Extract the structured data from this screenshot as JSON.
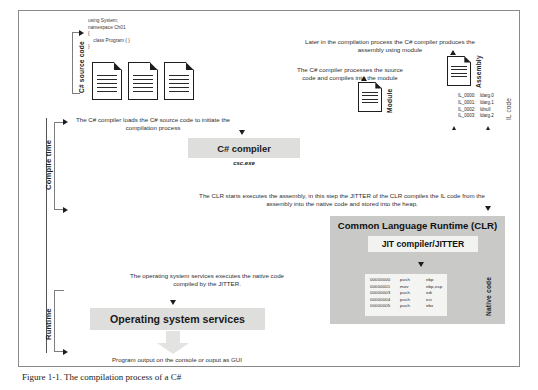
{
  "figure": {
    "caption": "Figure 1-1. The compilation process of a C#"
  },
  "timeline": {
    "compile_time_label": "Compile time",
    "runtime_label": "Runtime"
  },
  "source_stage": {
    "vertical_label": "C# source code",
    "snippet": [
      "using System;",
      "namespace Ch01",
      "{",
      "    class Program { }",
      "}"
    ],
    "doc_count": 3
  },
  "annotations": {
    "loads_source": "The C# compiler loads the C# source code to initiate the compilation process",
    "processes_source": "The C# compiler processes the source code and compiles into the module",
    "produces_assembly": "Later in the compilation process the C# compiler produces the assembly using module",
    "clr_executes": "The CLR starts executes the assembly, in this step the JITTER of the CLR compiles the IL code from the assembly into the native code and stored into the heap.",
    "os_executes": "The operating system services executes the native code compiled by the JITTER.",
    "program_output": "Program output on the console or ouput as GUI"
  },
  "compiler_box": {
    "title": "C# compiler",
    "subtitle": "csc.exe"
  },
  "module_stage": {
    "vertical_label": "Module"
  },
  "assembly_stage": {
    "vertical_label": "Assembly",
    "il_vertical_label": "IL code",
    "il_code": [
      {
        "label": "IL_0000:",
        "instr": "ldarg.0"
      },
      {
        "label": "IL_0001:",
        "instr": "ldarg.1"
      },
      {
        "label": "IL_0002:",
        "instr": "ldnull"
      },
      {
        "label": "IL_0003:",
        "instr": "ldarg.2"
      }
    ]
  },
  "clr": {
    "title": "Common Language Runtime (CLR)",
    "jit_title": "JIT compiler/JITTER",
    "native_vertical_label": "Native code",
    "native_code": [
      {
        "addr": "00000000",
        "op": "push",
        "args": "ebp"
      },
      {
        "addr": "00000001",
        "op": "mov",
        "args": "ebp,esp"
      },
      {
        "addr": "00000003",
        "op": "push",
        "args": "edi"
      },
      {
        "addr": "00000004",
        "op": "push",
        "args": "esi"
      },
      {
        "addr": "00000005",
        "op": "push",
        "args": "ebx"
      }
    ]
  },
  "os_box": {
    "title": "Operating system services"
  },
  "colors": {
    "grey_box": "#dededc",
    "clr_box": "#c9c9c7",
    "panel": "#f2f2f0",
    "frame_border": "#8a8a8a",
    "text": "#2f2f2f"
  }
}
